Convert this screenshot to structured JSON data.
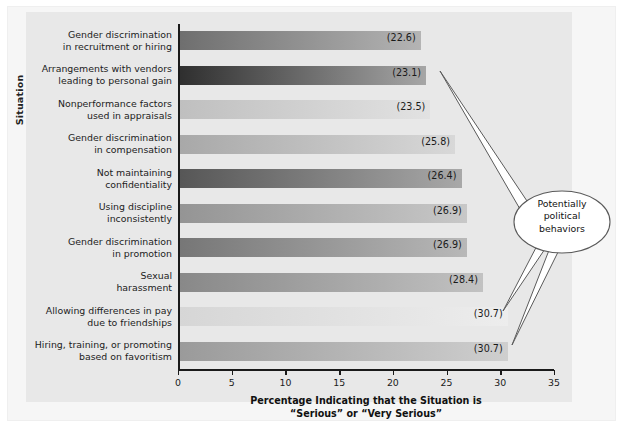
{
  "chart_data": {
    "type": "bar",
    "orientation": "horizontal",
    "title": "",
    "xlabel": "Percentage Indicating that the Situation is “Serious” or “Very Serious”",
    "ylabel": "Situation",
    "xlim": [
      0,
      35
    ],
    "xticks": [
      0,
      5,
      10,
      15,
      20,
      25,
      30,
      35
    ],
    "grid": false,
    "legend": false,
    "categories": [
      "Gender discrimination in recruitment or hiring",
      "Arrangements with vendors leading to personal gain",
      "Nonperformance factors used in appraisals",
      "Gender discrimination in compensation",
      "Not maintaining confidentiality",
      "Using discipline inconsistently",
      "Gender discrimination in promotion",
      "Sexual harassment",
      "Allowing differences in pay due to friendships",
      "Hiring, training, or promoting based on favoritism"
    ],
    "values": [
      22.6,
      23.1,
      23.5,
      25.8,
      26.4,
      26.9,
      26.9,
      28.4,
      30.7,
      30.7
    ],
    "value_labels": [
      "(22.6)",
      "(23.1)",
      "(23.5)",
      "(25.8)",
      "(26.4)",
      "(26.9)",
      "(26.9)",
      "(28.4)",
      "(30.7)",
      "(30.7)"
    ],
    "annotations": [
      {
        "text": "Potentially political behaviors",
        "points_to": [
          "Arrangements with vendors leading to personal gain",
          "Allowing differences in pay due to friendships",
          "Hiring, training, or promoting based on favoritism"
        ]
      }
    ]
  },
  "axis": {
    "y_title": "Situation",
    "x_title_line1": "Percentage Indicating that the Situation is",
    "x_title_line2": "“Serious” or “Very Serious”",
    "x_ticks": [
      "0",
      "5",
      "10",
      "15",
      "20",
      "25",
      "30",
      "35"
    ]
  },
  "rows": [
    {
      "label_line1": "Gender discrimination",
      "label_line2": "in recruitment or hiring",
      "value": 22.6,
      "value_label": "(22.6)",
      "color_start": "#6e6e6e",
      "color_end": "#b4b4b4"
    },
    {
      "label_line1": "Arrangements with vendors",
      "label_line2": "leading to personal gain",
      "value": 23.1,
      "value_label": "(23.1)",
      "color_start": "#2e2e2e",
      "color_end": "#a6a6a6"
    },
    {
      "label_line1": "Nonperformance factors",
      "label_line2": "used in appraisals",
      "value": 23.5,
      "value_label": "(23.5)",
      "color_start": "#bfbfbf",
      "color_end": "#e2e2e2"
    },
    {
      "label_line1": "Gender discrimination",
      "label_line2": "in compensation",
      "value": 25.8,
      "value_label": "(25.8)",
      "color_start": "#a8a8a8",
      "color_end": "#d8d8d8"
    },
    {
      "label_line1": "Not maintaining",
      "label_line2": "confidentiality",
      "value": 26.4,
      "value_label": "(26.4)",
      "color_start": "#565656",
      "color_end": "#a8a8a8"
    },
    {
      "label_line1": "Using discipline",
      "label_line2": "inconsistently",
      "value": 26.9,
      "value_label": "(26.9)",
      "color_start": "#949494",
      "color_end": "#c8c8c8"
    },
    {
      "label_line1": "Gender discrimination",
      "label_line2": "in promotion",
      "value": 26.9,
      "value_label": "(26.9)",
      "color_start": "#767676",
      "color_end": "#b8b8b8"
    },
    {
      "label_line1": "Sexual",
      "label_line2": "harassment",
      "value": 28.4,
      "value_label": "(28.4)",
      "color_start": "#888888",
      "color_end": "#c2c2c2"
    },
    {
      "label_line1": "Allowing differences in pay",
      "label_line2": "due to friendships",
      "value": 30.7,
      "value_label": "(30.7)",
      "color_start": "#d6d6d6",
      "color_end": "#ededed"
    },
    {
      "label_line1": "Hiring, training, or promoting",
      "label_line2": "based on favoritism",
      "value": 30.7,
      "value_label": "(30.7)",
      "color_start": "#9a9a9a",
      "color_end": "#cfcfcf"
    }
  ],
  "callout": {
    "line1": "Potentially",
    "line2": "political",
    "line3": "behaviors"
  }
}
